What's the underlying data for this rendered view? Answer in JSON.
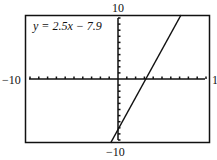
{
  "chart_data": {
    "type": "line",
    "title": "",
    "equation_label": "y = 2.5x − 7.9",
    "slope": 2.5,
    "intercept": -7.9,
    "series": [
      {
        "name": "y = 2.5x - 7.9",
        "x": [
          -0.84,
          7.16
        ],
        "y": [
          -10,
          10
        ]
      }
    ],
    "xlim": [
      -10,
      10
    ],
    "ylim": [
      -10,
      10
    ],
    "tick_step": 1,
    "grid": false,
    "labels": {
      "top": "10",
      "bottom": "−10",
      "left": "−10",
      "right": "1"
    },
    "xlabel": "",
    "ylabel": ""
  }
}
